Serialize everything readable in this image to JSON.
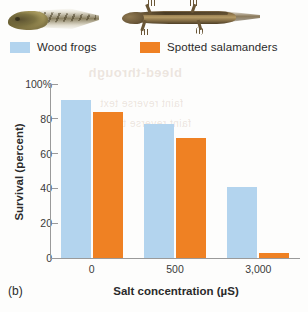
{
  "panel_label": "(b)",
  "photos": [
    {
      "name": "wood-frog-tadpole-photo",
      "alt": "Wood frog tadpole"
    },
    {
      "name": "spotted-salamander-larva-photo",
      "alt": "Spotted salamander larva"
    }
  ],
  "legend": {
    "position": "above-plot",
    "items": [
      {
        "label": "Wood frogs",
        "color": "#b3d4ee",
        "swatch_name": "legend-swatch-wood-frogs"
      },
      {
        "label": "Spotted salamanders",
        "color": "#ef8123",
        "swatch_name": "legend-swatch-spotted-salamanders"
      }
    ]
  },
  "ghost_text": {
    "line1": "bleed-through",
    "line2": "faint reverse text",
    "line3": "faint reverse text"
  },
  "chart_data": {
    "type": "bar",
    "title": "",
    "xlabel": "Salt concentration (µS)",
    "ylabel": "Survival (percent)",
    "categories": [
      "0",
      "500",
      "3,000"
    ],
    "ylim": [
      0,
      100
    ],
    "yticks": [
      "0",
      "20",
      "40",
      "60",
      "80",
      "100%"
    ],
    "ytick_values": [
      0,
      20,
      40,
      60,
      80,
      100
    ],
    "grid": false,
    "legend_position": "top-left-above-axes",
    "series": [
      {
        "name": "Wood frogs",
        "color": "#b3d4ee",
        "values": [
          91,
          77,
          41
        ]
      },
      {
        "name": "Spotted salamanders",
        "color": "#ef8123",
        "values": [
          84,
          69,
          3
        ]
      }
    ]
  }
}
